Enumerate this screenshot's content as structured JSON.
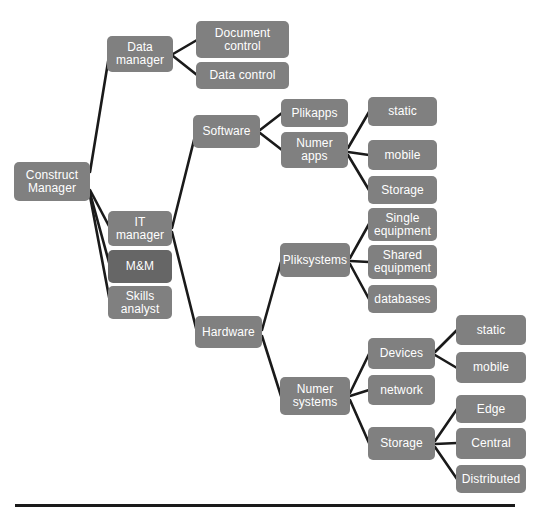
{
  "diagram": {
    "type": "tree",
    "background": "#ffffff",
    "node_fill": "#808080",
    "node_fill_highlight": "#666666",
    "node_text_color": "#ffffff",
    "edge_color": "#1a1a1a",
    "rule_color": "#1a1a1a"
  },
  "nodes": [
    {
      "id": "construct-manager",
      "label": "Construct\nManager",
      "x": 14,
      "y": 162,
      "w": 76,
      "h": 39,
      "fs": 12,
      "fill": "#808080"
    },
    {
      "id": "data-manager",
      "label": "Data\nmanager",
      "x": 107,
      "y": 36,
      "w": 66,
      "h": 36,
      "fs": 12,
      "fill": "#808080"
    },
    {
      "id": "document-control",
      "label": "Document\ncontrol",
      "x": 196,
      "y": 21,
      "w": 93,
      "h": 37,
      "fs": 12,
      "fill": "#808080"
    },
    {
      "id": "data-control",
      "label": "Data control",
      "x": 196,
      "y": 62,
      "w": 93,
      "h": 27,
      "fs": 12,
      "fill": "#808080"
    },
    {
      "id": "software",
      "label": "Software",
      "x": 193,
      "y": 115,
      "w": 67,
      "h": 33,
      "fs": 12,
      "fill": "#808080"
    },
    {
      "id": "plikapps",
      "label": "Plikapps",
      "x": 281,
      "y": 99,
      "w": 67,
      "h": 28,
      "fs": 12,
      "fill": "#808080"
    },
    {
      "id": "numer-apps",
      "label": "Numer\napps",
      "x": 281,
      "y": 132,
      "w": 67,
      "h": 36,
      "fs": 12,
      "fill": "#808080"
    },
    {
      "id": "sw-static",
      "label": "static",
      "x": 368,
      "y": 97,
      "w": 69,
      "h": 29,
      "fs": 12,
      "fill": "#808080"
    },
    {
      "id": "sw-mobile",
      "label": "mobile",
      "x": 368,
      "y": 140,
      "w": 69,
      "h": 30,
      "fs": 12,
      "fill": "#808080"
    },
    {
      "id": "sw-storage",
      "label": "Storage",
      "x": 368,
      "y": 176,
      "w": 69,
      "h": 28,
      "fs": 12,
      "fill": "#808080"
    },
    {
      "id": "it-manager",
      "label": "IT\nmanager",
      "x": 108,
      "y": 211,
      "w": 64,
      "h": 35,
      "fs": 12,
      "fill": "#808080"
    },
    {
      "id": "mm",
      "label": "M&M",
      "x": 108,
      "y": 250,
      "w": 64,
      "h": 33,
      "fs": 12,
      "fill": "#666666"
    },
    {
      "id": "skills-analyst",
      "label": "Skills\nanalyst",
      "x": 108,
      "y": 286,
      "w": 64,
      "h": 33,
      "fs": 12,
      "fill": "#808080"
    },
    {
      "id": "hardware",
      "label": "Hardware",
      "x": 195,
      "y": 316,
      "w": 67,
      "h": 32,
      "fs": 12,
      "fill": "#808080"
    },
    {
      "id": "pliksystems",
      "label": "Pliksystems",
      "x": 280,
      "y": 243,
      "w": 70,
      "h": 34,
      "fs": 12,
      "fill": "#808080"
    },
    {
      "id": "single-equipment",
      "label": "Single\nequipment",
      "x": 368,
      "y": 208,
      "w": 69,
      "h": 33,
      "fs": 12,
      "fill": "#808080"
    },
    {
      "id": "shared-equipment",
      "label": "Shared\nequipment",
      "x": 368,
      "y": 245,
      "w": 69,
      "h": 34,
      "fs": 12,
      "fill": "#808080"
    },
    {
      "id": "databases",
      "label": "databases",
      "x": 368,
      "y": 285,
      "w": 69,
      "h": 28,
      "fs": 12,
      "fill": "#808080"
    },
    {
      "id": "numer-systems",
      "label": "Numer\nsystems",
      "x": 280,
      "y": 377,
      "w": 70,
      "h": 38,
      "fs": 12,
      "fill": "#808080"
    },
    {
      "id": "devices",
      "label": "Devices",
      "x": 368,
      "y": 338,
      "w": 67,
      "h": 31,
      "fs": 12,
      "fill": "#808080"
    },
    {
      "id": "network",
      "label": "network",
      "x": 368,
      "y": 375,
      "w": 67,
      "h": 30,
      "fs": 12,
      "fill": "#808080"
    },
    {
      "id": "hw-storage",
      "label": "Storage",
      "x": 368,
      "y": 427,
      "w": 67,
      "h": 33,
      "fs": 12,
      "fill": "#808080"
    },
    {
      "id": "dev-static",
      "label": "static",
      "x": 456,
      "y": 315,
      "w": 70,
      "h": 30,
      "fs": 12,
      "fill": "#808080"
    },
    {
      "id": "dev-mobile",
      "label": "mobile",
      "x": 456,
      "y": 352,
      "w": 70,
      "h": 31,
      "fs": 12,
      "fill": "#808080"
    },
    {
      "id": "edge",
      "label": "Edge",
      "x": 456,
      "y": 395,
      "w": 70,
      "h": 28,
      "fs": 12,
      "fill": "#808080"
    },
    {
      "id": "central",
      "label": "Central",
      "x": 456,
      "y": 428,
      "w": 70,
      "h": 31,
      "fs": 12,
      "fill": "#808080"
    },
    {
      "id": "distributed",
      "label": "Distributed",
      "x": 456,
      "y": 465,
      "w": 70,
      "h": 28,
      "fs": 12,
      "fill": "#808080"
    }
  ],
  "edges": [
    {
      "from": "construct-manager",
      "to": "data-manager",
      "x1": 90,
      "y1": 172,
      "x2": 109,
      "y2": 56
    },
    {
      "from": "construct-manager",
      "to": "it-manager",
      "x1": 90,
      "y1": 190,
      "x2": 110,
      "y2": 228
    },
    {
      "from": "construct-manager",
      "to": "mm",
      "x1": 90,
      "y1": 193,
      "x2": 110,
      "y2": 266
    },
    {
      "from": "construct-manager",
      "to": "skills-analyst",
      "x1": 90,
      "y1": 196,
      "x2": 110,
      "y2": 302
    },
    {
      "from": "data-manager",
      "to": "document-control",
      "x1": 173,
      "y1": 54,
      "x2": 197,
      "y2": 40
    },
    {
      "from": "data-manager",
      "to": "data-control",
      "x1": 173,
      "y1": 56,
      "x2": 197,
      "y2": 75
    },
    {
      "from": "it-manager",
      "to": "software",
      "x1": 172,
      "y1": 228,
      "x2": 196,
      "y2": 132
    },
    {
      "from": "it-manager",
      "to": "hardware",
      "x1": 172,
      "y1": 232,
      "x2": 197,
      "y2": 332
    },
    {
      "from": "software",
      "to": "plikapps",
      "x1": 260,
      "y1": 130,
      "x2": 282,
      "y2": 113
    },
    {
      "from": "software",
      "to": "numer-apps",
      "x1": 260,
      "y1": 133,
      "x2": 282,
      "y2": 150
    },
    {
      "from": "numer-apps",
      "to": "sw-static",
      "x1": 348,
      "y1": 148,
      "x2": 369,
      "y2": 112
    },
    {
      "from": "numer-apps",
      "to": "sw-mobile",
      "x1": 348,
      "y1": 152,
      "x2": 369,
      "y2": 155
    },
    {
      "from": "numer-apps",
      "to": "sw-storage",
      "x1": 348,
      "y1": 155,
      "x2": 369,
      "y2": 190
    },
    {
      "from": "hardware",
      "to": "pliksystems",
      "x1": 262,
      "y1": 330,
      "x2": 281,
      "y2": 262
    },
    {
      "from": "hardware",
      "to": "numer-systems",
      "x1": 262,
      "y1": 336,
      "x2": 281,
      "y2": 396
    },
    {
      "from": "pliksystems",
      "to": "single-equipment",
      "x1": 350,
      "y1": 258,
      "x2": 369,
      "y2": 224
    },
    {
      "from": "pliksystems",
      "to": "shared-equipment",
      "x1": 350,
      "y1": 261,
      "x2": 369,
      "y2": 262
    },
    {
      "from": "pliksystems",
      "to": "databases",
      "x1": 350,
      "y1": 264,
      "x2": 369,
      "y2": 299
    },
    {
      "from": "numer-systems",
      "to": "devices",
      "x1": 350,
      "y1": 393,
      "x2": 369,
      "y2": 354
    },
    {
      "from": "numer-systems",
      "to": "network",
      "x1": 350,
      "y1": 396,
      "x2": 369,
      "y2": 390
    },
    {
      "from": "numer-systems",
      "to": "hw-storage",
      "x1": 350,
      "y1": 400,
      "x2": 369,
      "y2": 443
    },
    {
      "from": "devices",
      "to": "dev-static",
      "x1": 435,
      "y1": 352,
      "x2": 457,
      "y2": 330
    },
    {
      "from": "devices",
      "to": "dev-mobile",
      "x1": 435,
      "y1": 355,
      "x2": 457,
      "y2": 368
    },
    {
      "from": "hw-storage",
      "to": "edge",
      "x1": 435,
      "y1": 441,
      "x2": 457,
      "y2": 409
    },
    {
      "from": "hw-storage",
      "to": "central",
      "x1": 435,
      "y1": 444,
      "x2": 457,
      "y2": 443
    },
    {
      "from": "hw-storage",
      "to": "distributed",
      "x1": 435,
      "y1": 447,
      "x2": 457,
      "y2": 479
    }
  ],
  "rule": {
    "x": 15,
    "y": 504,
    "w": 500,
    "h": 3
  }
}
